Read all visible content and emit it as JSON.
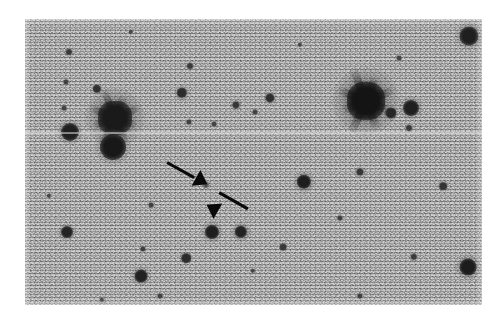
{
  "page": {
    "background_color": "#ffffff",
    "width": 502,
    "height": 323
  },
  "figure": {
    "name": "astronomical-star-field",
    "caption": "",
    "type": "grayscale astronomical image",
    "frame": {
      "x": 25,
      "y": 19,
      "width": 457,
      "height": 286
    },
    "background_color": "#a6a6a6",
    "grain_description": "fine photographic / CCD noise grain",
    "defects": [
      {
        "name": "horizontal-scan-line",
        "y": 132,
        "color": "#f8f8f8",
        "thickness": 2
      }
    ],
    "markers": [
      {
        "name": "arrow-upper-left",
        "label": "",
        "color": "#0a0a0a",
        "tail_x": 167,
        "tail_y": 163,
        "tip_x": 203,
        "tip_y": 183,
        "angle_deg": 29
      },
      {
        "name": "arrow-lower-right",
        "label": "",
        "color": "#0a0a0a",
        "tail_x": 248,
        "tail_y": 209,
        "tip_x": 211,
        "tip_y": 188,
        "angle_deg": 209
      }
    ],
    "target_object": {
      "name": "marked-faint-source",
      "x": 206,
      "y": 185,
      "radius": 3.2,
      "brightness": "faint",
      "color": "#3c3c3c"
    },
    "stars": [
      {
        "name": "bright-star-left",
        "x": 115,
        "y": 118,
        "r": 17,
        "color": "#1a1a1a",
        "spikes": true,
        "halo": 30
      },
      {
        "name": "bright-star-right",
        "x": 366,
        "y": 101,
        "r": 19,
        "color": "#141414",
        "spikes": true,
        "halo": 34
      },
      {
        "name": "star-top-right-bright",
        "x": 469,
        "y": 36,
        "r": 9.5,
        "color": "#1f1f1f",
        "spikes": false,
        "halo": 14
      },
      {
        "name": "star-left-mid",
        "x": 70,
        "y": 132,
        "r": 9,
        "color": "#1f1f1f",
        "spikes": false,
        "halo": 13
      },
      {
        "name": "star-below-bright-left",
        "x": 113,
        "y": 147,
        "r": 13,
        "color": "#181818",
        "spikes": false,
        "halo": 18
      },
      {
        "name": "star-upper-small-1",
        "x": 69,
        "y": 52,
        "r": 3.0,
        "color": "#3a3a3a",
        "spikes": false,
        "halo": 5
      },
      {
        "name": "star-upper-small-2",
        "x": 66,
        "y": 82,
        "r": 2.6,
        "color": "#3f3f3f",
        "spikes": false,
        "halo": 4
      },
      {
        "name": "star-upper-small-3",
        "x": 64,
        "y": 108,
        "r": 2.4,
        "color": "#434343",
        "spikes": false,
        "halo": 4
      },
      {
        "name": "star-upper-small-4",
        "x": 97,
        "y": 89,
        "r": 4.2,
        "color": "#303030",
        "spikes": false,
        "halo": 6
      },
      {
        "name": "star-mid-small-1",
        "x": 182,
        "y": 93,
        "r": 5.2,
        "color": "#2c2c2c",
        "spikes": false,
        "halo": 8
      },
      {
        "name": "star-mid-small-2",
        "x": 190,
        "y": 66,
        "r": 3.0,
        "color": "#3b3b3b",
        "spikes": false,
        "halo": 5
      },
      {
        "name": "star-mid-small-3",
        "x": 236,
        "y": 105,
        "r": 3.6,
        "color": "#363636",
        "spikes": false,
        "halo": 6
      },
      {
        "name": "star-mid-small-4",
        "x": 189,
        "y": 122,
        "r": 2.6,
        "color": "#404040",
        "spikes": false,
        "halo": 4
      },
      {
        "name": "star-mid-small-5",
        "x": 214,
        "y": 124,
        "r": 2.4,
        "color": "#444444",
        "spikes": false,
        "halo": 4
      },
      {
        "name": "star-upper-right-1",
        "x": 270,
        "y": 98,
        "r": 4.6,
        "color": "#2e2e2e",
        "spikes": false,
        "halo": 7
      },
      {
        "name": "star-right-of-bright",
        "x": 411,
        "y": 108,
        "r": 8.0,
        "color": "#202020",
        "spikes": false,
        "halo": 12
      },
      {
        "name": "star-near-bright-right-1",
        "x": 391,
        "y": 113,
        "r": 5.6,
        "color": "#272727",
        "spikes": false,
        "halo": 8
      },
      {
        "name": "star-near-bright-right-2",
        "x": 409,
        "y": 128,
        "r": 3.0,
        "color": "#3a3a3a",
        "spikes": false,
        "halo": 5
      },
      {
        "name": "star-far-right-small",
        "x": 255,
        "y": 112,
        "r": 2.4,
        "color": "#424242",
        "spikes": false,
        "halo": 4
      },
      {
        "name": "star-lower-left-1",
        "x": 67,
        "y": 232,
        "r": 6.0,
        "color": "#242424",
        "spikes": false,
        "halo": 9
      },
      {
        "name": "star-lower-mid-1",
        "x": 141,
        "y": 276,
        "r": 6.4,
        "color": "#222222",
        "spikes": false,
        "halo": 10
      },
      {
        "name": "star-lower-mid-2",
        "x": 186,
        "y": 258,
        "r": 4.8,
        "color": "#2b2b2b",
        "spikes": false,
        "halo": 7
      },
      {
        "name": "star-lower-mid-3",
        "x": 143,
        "y": 249,
        "r": 2.6,
        "color": "#3e3e3e",
        "spikes": false,
        "halo": 4
      },
      {
        "name": "star-lower-mid-4",
        "x": 151,
        "y": 205,
        "r": 2.4,
        "color": "#414141",
        "spikes": false,
        "halo": 4
      },
      {
        "name": "star-lower-right-1",
        "x": 212,
        "y": 232,
        "r": 7.0,
        "color": "#1f1f1f",
        "spikes": false,
        "halo": 11
      },
      {
        "name": "star-lower-right-2",
        "x": 241,
        "y": 232,
        "r": 6.2,
        "color": "#232323",
        "spikes": false,
        "halo": 10
      },
      {
        "name": "star-lower-right-3",
        "x": 304,
        "y": 182,
        "r": 7.2,
        "color": "#1e1e1e",
        "spikes": false,
        "halo": 11
      },
      {
        "name": "star-lower-right-4",
        "x": 360,
        "y": 172,
        "r": 3.6,
        "color": "#363636",
        "spikes": false,
        "halo": 6
      },
      {
        "name": "star-lower-right-5",
        "x": 443,
        "y": 186,
        "r": 3.8,
        "color": "#343434",
        "spikes": false,
        "halo": 6
      },
      {
        "name": "star-lower-right-6",
        "x": 340,
        "y": 218,
        "r": 2.6,
        "color": "#3f3f3f",
        "spikes": false,
        "halo": 4
      },
      {
        "name": "star-lower-right-7",
        "x": 283,
        "y": 247,
        "r": 3.4,
        "color": "#383838",
        "spikes": false,
        "halo": 5
      },
      {
        "name": "star-lower-right-8",
        "x": 414,
        "y": 257,
        "r": 3.2,
        "color": "#3a3a3a",
        "spikes": false,
        "halo": 5
      },
      {
        "name": "star-lower-right-9",
        "x": 468,
        "y": 267,
        "r": 8.4,
        "color": "#1c1c1c",
        "spikes": false,
        "halo": 13
      },
      {
        "name": "star-lower-right-10",
        "x": 360,
        "y": 296,
        "r": 2.6,
        "color": "#3f3f3f",
        "spikes": false,
        "halo": 4
      },
      {
        "name": "star-lower-left-small-1",
        "x": 160,
        "y": 296,
        "r": 2.4,
        "color": "#424242",
        "spikes": false,
        "halo": 4
      },
      {
        "name": "star-lower-left-small-2",
        "x": 102,
        "y": 300,
        "r": 2.2,
        "color": "#454545",
        "spikes": false,
        "halo": 4
      },
      {
        "name": "star-lower-left-small-3",
        "x": 49,
        "y": 196,
        "r": 2.2,
        "color": "#464646",
        "spikes": false,
        "halo": 3
      },
      {
        "name": "star-lower-left-small-4",
        "x": 253,
        "y": 271,
        "r": 2.2,
        "color": "#454545",
        "spikes": false,
        "halo": 3
      },
      {
        "name": "star-top-small-1",
        "x": 131,
        "y": 32,
        "r": 2.2,
        "color": "#474747",
        "spikes": false,
        "halo": 3
      },
      {
        "name": "star-top-small-2",
        "x": 300,
        "y": 45,
        "r": 2.2,
        "color": "#474747",
        "spikes": false,
        "halo": 3
      },
      {
        "name": "star-top-small-3",
        "x": 399,
        "y": 58,
        "r": 2.4,
        "color": "#444444",
        "spikes": false,
        "halo": 4
      }
    ]
  }
}
